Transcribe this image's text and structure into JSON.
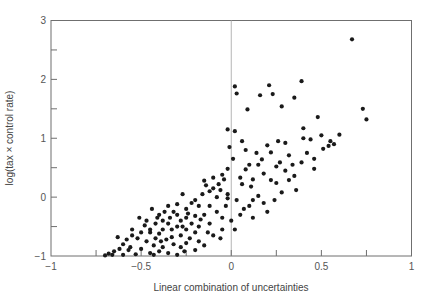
{
  "chart_data": {
    "type": "scatter",
    "title": "",
    "xlabel": "Linear combination of uncertainties",
    "ylabel": "log(tax × control rate)",
    "xlim": [
      -1,
      1
    ],
    "ylim": [
      -1,
      3
    ],
    "xticks": [
      -1,
      -0.5,
      0,
      0.5,
      1
    ],
    "xtick_labels": [
      "−1",
      "−0.5",
      "0",
      "0.5",
      "1"
    ],
    "yticks": [
      -1,
      0,
      1,
      2,
      3
    ],
    "ytick_labels": [
      "−1",
      "0",
      "1",
      "2",
      "3"
    ],
    "minor_xticks": [
      -0.75,
      -0.25,
      0.25,
      0.75
    ],
    "minor_yticks": [
      -0.5,
      0.5,
      1.5,
      2.5
    ],
    "grid": false,
    "reference_line": {
      "x": 0,
      "orientation": "vertical"
    },
    "legend": null,
    "points": [
      [
        0.67,
        2.68
      ],
      [
        0.39,
        1.97
      ],
      [
        0.21,
        1.9
      ],
      [
        0.02,
        1.88
      ],
      [
        0.03,
        1.76
      ],
      [
        0.23,
        1.75
      ],
      [
        0.16,
        1.73
      ],
      [
        0.35,
        1.69
      ],
      [
        0.28,
        1.54
      ],
      [
        0.09,
        1.49
      ],
      [
        0.73,
        1.5
      ],
      [
        0.75,
        1.32
      ],
      [
        0.48,
        1.36
      ],
      [
        0.4,
        1.17
      ],
      [
        0.6,
        1.06
      ],
      [
        0.55,
        0.95
      ],
      [
        0.54,
        0.87
      ],
      [
        0.51,
        0.82
      ],
      [
        -0.02,
        1.15
      ],
      [
        0.02,
        1.12
      ],
      [
        0.4,
        1.0
      ],
      [
        0.44,
        0.98
      ],
      [
        0.3,
        0.92
      ],
      [
        0.2,
        0.88
      ],
      [
        0.22,
        0.76
      ],
      [
        0.32,
        0.71
      ],
      [
        0.39,
        0.59
      ],
      [
        0.27,
        0.59
      ],
      [
        0.25,
        0.52
      ],
      [
        0.46,
        0.48
      ],
      [
        0.17,
        0.64
      ],
      [
        0.15,
        0.55
      ],
      [
        0.1,
        0.55
      ],
      [
        0.08,
        0.47
      ],
      [
        0.12,
        0.3
      ],
      [
        0.22,
        0.29
      ],
      [
        0.25,
        0.24
      ],
      [
        0.32,
        0.29
      ],
      [
        0.35,
        0.36
      ],
      [
        0.05,
        0.33
      ],
      [
        0.06,
        0.22
      ],
      [
        -0.02,
        0.48
      ],
      [
        -0.05,
        0.38
      ],
      [
        -0.04,
        0.3
      ],
      [
        -0.07,
        0.22
      ],
      [
        -0.06,
        0.12
      ],
      [
        -0.12,
        0.1
      ],
      [
        -0.1,
        0.15
      ],
      [
        -0.14,
        0.2
      ],
      [
        -0.15,
        0.28
      ],
      [
        -0.1,
        0.33
      ],
      [
        -0.02,
        0.05
      ],
      [
        -0.02,
        -0.02
      ],
      [
        0.03,
        -0.05
      ],
      [
        0.07,
        -0.2
      ],
      [
        0.12,
        -0.05
      ],
      [
        0.15,
        0.02
      ],
      [
        0.18,
        -0.1
      ],
      [
        0.24,
        -0.05
      ],
      [
        0.0,
        -0.4
      ],
      [
        0.05,
        -0.3
      ],
      [
        0.1,
        -0.15
      ],
      [
        -0.2,
        -0.05
      ],
      [
        -0.18,
        -0.15
      ],
      [
        -0.22,
        -0.1
      ],
      [
        -0.25,
        -0.2
      ],
      [
        -0.12,
        -0.15
      ],
      [
        -0.08,
        -0.25
      ],
      [
        -0.05,
        -0.35
      ],
      [
        -0.15,
        -0.3
      ],
      [
        -0.2,
        -0.32
      ],
      [
        -0.25,
        -0.35
      ],
      [
        -0.28,
        -0.4
      ],
      [
        -0.3,
        -0.3
      ],
      [
        -0.32,
        -0.25
      ],
      [
        -0.35,
        -0.15
      ],
      [
        -0.22,
        -0.45
      ],
      [
        -0.18,
        -0.5
      ],
      [
        -0.12,
        -0.45
      ],
      [
        -0.05,
        -0.55
      ],
      [
        -0.1,
        -0.65
      ],
      [
        -0.2,
        -0.6
      ],
      [
        -0.25,
        -0.55
      ],
      [
        -0.28,
        -0.65
      ],
      [
        -0.3,
        -0.5
      ],
      [
        -0.33,
        -0.55
      ],
      [
        -0.35,
        -0.45
      ],
      [
        -0.38,
        -0.4
      ],
      [
        -0.4,
        -0.3
      ],
      [
        -0.42,
        -0.45
      ],
      [
        -0.38,
        -0.55
      ],
      [
        -0.4,
        -0.62
      ],
      [
        -0.45,
        -0.55
      ],
      [
        -0.48,
        -0.48
      ],
      [
        -0.5,
        -0.6
      ],
      [
        -0.42,
        -0.7
      ],
      [
        -0.36,
        -0.72
      ],
      [
        -0.32,
        -0.8
      ],
      [
        -0.28,
        -0.85
      ],
      [
        -0.25,
        -0.78
      ],
      [
        -0.2,
        -0.9
      ],
      [
        -0.18,
        -0.75
      ],
      [
        -0.38,
        -0.85
      ],
      [
        -0.43,
        -0.82
      ],
      [
        -0.47,
        -0.75
      ],
      [
        -0.52,
        -0.7
      ],
      [
        -0.55,
        -0.65
      ],
      [
        -0.58,
        -0.72
      ],
      [
        -0.6,
        -0.8
      ],
      [
        -0.56,
        -0.85
      ],
      [
        -0.5,
        -0.88
      ],
      [
        -0.45,
        -0.95
      ],
      [
        -0.4,
        -0.92
      ],
      [
        -0.35,
        -0.95
      ],
      [
        -0.3,
        -0.98
      ],
      [
        -0.62,
        -0.88
      ],
      [
        -0.65,
        -0.92
      ],
      [
        -0.68,
        -0.96
      ],
      [
        -0.7,
        -0.99
      ],
      [
        -0.66,
        -0.98
      ],
      [
        -0.6,
        -0.98
      ],
      [
        -0.53,
        -0.97
      ],
      [
        -0.45,
        -0.6
      ],
      [
        -0.41,
        -0.35
      ],
      [
        -0.37,
        -0.25
      ],
      [
        -0.3,
        -0.12
      ],
      [
        -0.27,
        0.05
      ],
      [
        -0.24,
        -0.28
      ],
      [
        -0.16,
        0.05
      ],
      [
        -0.08,
        0.0
      ],
      [
        0.01,
        0.65
      ],
      [
        -0.01,
        0.85
      ],
      [
        0.08,
        0.8
      ],
      [
        0.14,
        0.75
      ],
      [
        0.06,
        0.95
      ],
      [
        0.42,
        0.75
      ],
      [
        0.46,
        0.65
      ],
      [
        0.3,
        0.45
      ],
      [
        0.18,
        0.4
      ],
      [
        0.36,
        0.12
      ],
      [
        0.28,
        0.08
      ],
      [
        0.2,
        -0.25
      ],
      [
        -0.33,
        -0.68
      ],
      [
        -0.47,
        -0.4
      ],
      [
        -0.55,
        -0.55
      ],
      [
        -0.44,
        -0.2
      ],
      [
        -0.51,
        -0.35
      ],
      [
        -0.63,
        -0.68
      ],
      [
        -0.57,
        -0.9
      ],
      [
        -0.43,
        -0.98
      ],
      [
        -0.26,
        -0.92
      ],
      [
        -0.15,
        -0.82
      ],
      [
        -0.23,
        -0.7
      ],
      [
        -0.13,
        -0.6
      ],
      [
        -0.06,
        -0.7
      ],
      [
        0.02,
        -0.55
      ],
      [
        0.12,
        -0.35
      ],
      [
        -0.03,
        -0.15
      ],
      [
        -0.17,
        -0.38
      ],
      [
        -0.27,
        -0.5
      ],
      [
        -0.34,
        -0.35
      ],
      [
        -0.39,
        -0.75
      ],
      [
        0.26,
        0.95
      ],
      [
        0.34,
        0.55
      ],
      [
        0.5,
        1.05
      ],
      [
        0.57,
        0.9
      ],
      [
        0.11,
        0.18
      ]
    ]
  },
  "colors": {
    "axis": "#6f6f6f",
    "ref_line": "#b5b5b5",
    "point": "#1a1a1a",
    "text": "#555555"
  }
}
